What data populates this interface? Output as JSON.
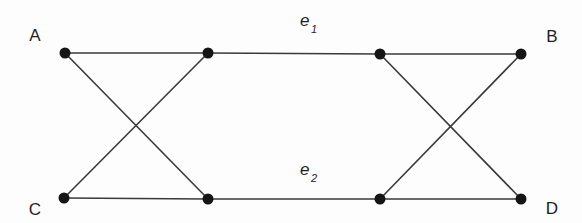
{
  "diagram": {
    "type": "graph",
    "colors": {
      "edge": "#3a3a3a",
      "node": "#151515",
      "text": "#1e1e1e",
      "background": "#fdfdfd"
    },
    "vertices": [
      {
        "id": "A",
        "label": "A",
        "x": 65,
        "y": 53,
        "label_x": 35,
        "label_y": 41
      },
      {
        "id": "n2",
        "label": "",
        "x": 208,
        "y": 53
      },
      {
        "id": "n3",
        "label": "",
        "x": 380,
        "y": 54
      },
      {
        "id": "B",
        "label": "B",
        "x": 521,
        "y": 54,
        "label_x": 552,
        "label_y": 42
      },
      {
        "id": "C",
        "label": "C",
        "x": 64,
        "y": 198,
        "label_x": 35,
        "label_y": 215
      },
      {
        "id": "n6",
        "label": "",
        "x": 208,
        "y": 199
      },
      {
        "id": "n7",
        "label": "",
        "x": 380,
        "y": 199
      },
      {
        "id": "D",
        "label": "D",
        "x": 521,
        "y": 199,
        "label_x": 552,
        "label_y": 214
      }
    ],
    "edges": [
      {
        "from": "A",
        "to": "n2"
      },
      {
        "from": "n2",
        "to": "n3",
        "label": "e",
        "subscript": "1",
        "label_x": 300,
        "label_y": 26,
        "sub_x": 311,
        "sub_y": 33
      },
      {
        "from": "n3",
        "to": "B"
      },
      {
        "from": "C",
        "to": "n6"
      },
      {
        "from": "n6",
        "to": "n7",
        "label": "e",
        "subscript": "2",
        "label_x": 300,
        "label_y": 175,
        "sub_x": 311,
        "sub_y": 182
      },
      {
        "from": "n7",
        "to": "D"
      },
      {
        "from": "A",
        "to": "n6"
      },
      {
        "from": "C",
        "to": "n2"
      },
      {
        "from": "n3",
        "to": "D"
      },
      {
        "from": "n7",
        "to": "B"
      }
    ]
  }
}
